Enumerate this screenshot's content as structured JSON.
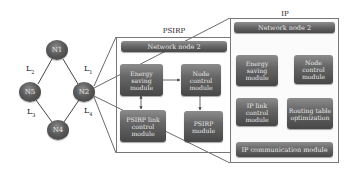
{
  "network": {
    "nodes": [
      {
        "id": "N1",
        "label": "N1"
      },
      {
        "id": "N2",
        "label": "N2"
      },
      {
        "id": "N4",
        "label": "N4"
      },
      {
        "id": "N5",
        "label": "N5"
      }
    ],
    "links": [
      {
        "id": "L1",
        "base": "L",
        "sub": "1",
        "from": "N1",
        "to": "N2"
      },
      {
        "id": "L2",
        "base": "L",
        "sub": "2",
        "from": "N1",
        "to": "N5"
      },
      {
        "id": "L3",
        "base": "L",
        "sub": "3",
        "from": "N5",
        "to": "N4"
      },
      {
        "id": "L4",
        "base": "L",
        "sub": "4",
        "from": "N2",
        "to": "N4"
      }
    ]
  },
  "psirp": {
    "title": "PSIRP",
    "header": "Network node 2",
    "modules": {
      "energy": "Energy saving module",
      "node_control": "Node control module",
      "link_control": "PSIRP link control module",
      "psirp_module": "PSIRP module"
    }
  },
  "ip": {
    "title": "IP",
    "header": "Network node 2",
    "modules": {
      "energy": "Energy saving module",
      "node_control": "Node control module",
      "link_control": "IP link control module",
      "routing": "Routing table optimization",
      "communication": "IP communication module"
    }
  },
  "colors": {
    "module_fill": "#5e5e5e",
    "node_fill": "#555555",
    "frame_border": "#777777",
    "line": "#444444"
  }
}
